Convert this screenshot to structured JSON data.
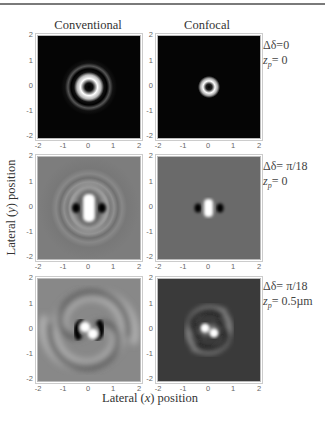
{
  "figure": {
    "columns": [
      {
        "title": "Conventional"
      },
      {
        "title": "Confocal"
      }
    ],
    "rows": [
      {
        "delta_label": "Δδ=0",
        "zp_prefix": "z",
        "zp_sub": "p",
        "zp_value": "= 0"
      },
      {
        "delta_label": "Δδ= π/18",
        "zp_prefix": "z",
        "zp_sub": "p",
        "zp_value": "= 0"
      },
      {
        "delta_label": "Δδ= π/18",
        "zp_prefix": "z",
        "zp_sub": "p",
        "zp_value": "= 0.5µm"
      }
    ],
    "panels": [
      {
        "row": 0,
        "col": 0,
        "description": "donut ring with faint outer ring on black background"
      },
      {
        "row": 0,
        "col": 1,
        "description": "small donut ring on black background"
      },
      {
        "row": 1,
        "col": 0,
        "description": "central bright bar flanked by two dark lobes with concentric rings, gray background"
      },
      {
        "row": 1,
        "col": 1,
        "description": "small bright bar flanked by dark lobes, gray background"
      },
      {
        "row": 2,
        "col": 0,
        "description": "two-arm spiral pattern on gray background"
      },
      {
        "row": 2,
        "col": 1,
        "description": "compact two-arm spiral on dark background"
      }
    ],
    "y_ticks": [
      "2",
      "1",
      "0",
      "-1",
      "-2"
    ],
    "x_ticks": [
      "-2",
      "-1",
      "0",
      "1",
      "2"
    ],
    "y_axis_label_prefix": "Lateral (",
    "y_axis_label_var": "y",
    "y_axis_label_suffix": ") position",
    "x_axis_label_prefix": "Lateral (",
    "x_axis_label_var": "x",
    "x_axis_label_suffix": ") position",
    "colors": {
      "dark_bg": "#050505",
      "gray_bg_conventional": "#7d7d7d",
      "gray_bg_confocal_row2": "#6a6a6a",
      "dark_gray_bg_confocal_row3": "#3a3a3a",
      "text": "#333333",
      "tick": "#666666"
    }
  }
}
